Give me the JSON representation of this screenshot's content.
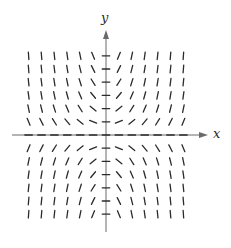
{
  "diagram": {
    "type": "slope-field",
    "equation_form": "dy/dx = x*y",
    "axes": {
      "x_label": "x",
      "y_label": "y",
      "color": "#555555"
    },
    "grid": {
      "x_values": [
        -6,
        -5,
        -4,
        -3,
        -2,
        -1,
        0,
        1,
        2,
        3,
        4,
        5,
        6
      ],
      "y_values": [
        -6,
        -5,
        -4,
        -3,
        -2,
        -1,
        0,
        1,
        2,
        3,
        4,
        5,
        6
      ],
      "origin_px": [
        106,
        135
      ],
      "spacing_px": [
        12.9,
        13.2
      ],
      "segment_length_px": 7.5,
      "scale": 0.5
    },
    "colors": {
      "segment": "#2b2b2b",
      "axis": "#6a6a6a",
      "background": "#ffffff"
    }
  }
}
